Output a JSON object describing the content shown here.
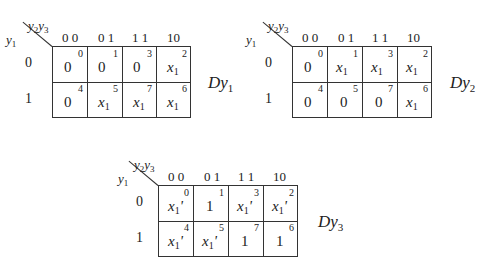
{
  "maps": [
    {
      "name": "Dy",
      "name_sub": "1",
      "corner_col": {
        "a": "y",
        "a_sub": "2",
        "b": "y",
        "b_sub": "3"
      },
      "corner_row": {
        "a": "y",
        "a_sub": "1"
      },
      "col_headers": [
        "0 0",
        "0 1",
        "1 1",
        "10"
      ],
      "row_headers": [
        "0",
        "1"
      ],
      "cells": [
        [
          {
            "v": "0",
            "s": "",
            "p": "",
            "i": "0"
          },
          {
            "v": "0",
            "s": "",
            "p": "",
            "i": "1"
          },
          {
            "v": "0",
            "s": "",
            "p": "",
            "i": "3"
          },
          {
            "v": "x",
            "s": "1",
            "p": "",
            "i": "2"
          }
        ],
        [
          {
            "v": "0",
            "s": "",
            "p": "",
            "i": "4"
          },
          {
            "v": "x",
            "s": "1",
            "p": "",
            "i": "5"
          },
          {
            "v": "x",
            "s": "1",
            "p": "",
            "i": "7"
          },
          {
            "v": "x",
            "s": "1",
            "p": "",
            "i": "6"
          }
        ]
      ]
    },
    {
      "name": "Dy",
      "name_sub": "2",
      "corner_col": {
        "a": "y",
        "a_sub": "2",
        "b": "y",
        "b_sub": "3"
      },
      "corner_row": {
        "a": "y",
        "a_sub": "1"
      },
      "col_headers": [
        "0 0",
        "0 1",
        "1 1",
        "10"
      ],
      "row_headers": [
        "0",
        "1"
      ],
      "cells": [
        [
          {
            "v": "0",
            "s": "",
            "p": "",
            "i": "0"
          },
          {
            "v": "x",
            "s": "1",
            "p": "",
            "i": "1"
          },
          {
            "v": "x",
            "s": "1",
            "p": "",
            "i": "3"
          },
          {
            "v": "x",
            "s": "1",
            "p": "",
            "i": "2"
          }
        ],
        [
          {
            "v": "0",
            "s": "",
            "p": "",
            "i": "4"
          },
          {
            "v": "0",
            "s": "",
            "p": "",
            "i": "5"
          },
          {
            "v": "0",
            "s": "",
            "p": "",
            "i": "7"
          },
          {
            "v": "x",
            "s": "1",
            "p": "",
            "i": "6"
          }
        ]
      ]
    },
    {
      "name": "Dy",
      "name_sub": "3",
      "corner_col": {
        "a": "y",
        "a_sub": "2",
        "b": "y",
        "b_sub": "3"
      },
      "corner_row": {
        "a": "y",
        "a_sub": "1"
      },
      "col_headers": [
        "0 0",
        "0 1",
        "1 1",
        "10"
      ],
      "row_headers": [
        "0",
        "1"
      ],
      "cells": [
        [
          {
            "v": "x",
            "s": "1",
            "p": "'",
            "i": "0"
          },
          {
            "v": "1",
            "s": "",
            "p": "",
            "i": "1"
          },
          {
            "v": "x",
            "s": "1",
            "p": "'",
            "i": "3"
          },
          {
            "v": "x",
            "s": "1",
            "p": "'",
            "i": "2"
          }
        ],
        [
          {
            "v": "x",
            "s": "1",
            "p": "'",
            "i": "4"
          },
          {
            "v": "x",
            "s": "1",
            "p": "'",
            "i": "5"
          },
          {
            "v": "1",
            "s": "",
            "p": "",
            "i": "7"
          },
          {
            "v": "1",
            "s": "",
            "p": "",
            "i": "6"
          }
        ]
      ]
    }
  ]
}
